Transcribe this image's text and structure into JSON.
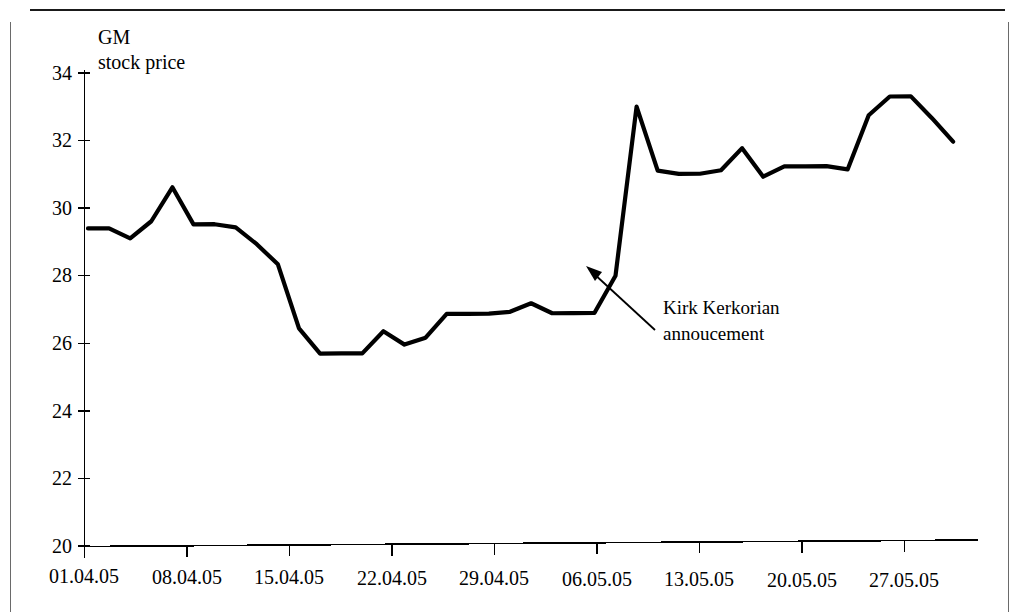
{
  "page": {
    "background": "#ffffff",
    "ink_color": "#000000"
  },
  "chart_title": {
    "line1": "GM",
    "line2": "stock price"
  },
  "annotation": {
    "line1": "Kirk Kerkorian",
    "line2": "annoucement",
    "points_to": "2005-05-04 spike"
  },
  "chart_data": {
    "type": "line",
    "title": "GM stock price",
    "xlabel": "",
    "ylabel": "",
    "ylim": [
      20,
      34
    ],
    "yticks": [
      20,
      22,
      24,
      26,
      28,
      30,
      32,
      34
    ],
    "ytick_labels": [
      "20",
      "22",
      "24",
      "26",
      "28",
      "30",
      "32",
      "34"
    ],
    "xtick_labels": [
      "01.04.05",
      "08.04.05",
      "15.04.05",
      "22.04.05",
      "29.04.05",
      "06.05.05",
      "13.05.05",
      "20.05.05",
      "27.05.05"
    ],
    "xtick_index": [
      0,
      5,
      10,
      15,
      20,
      25,
      30,
      35,
      40
    ],
    "grid": false,
    "legend": null,
    "line_color": "#000000",
    "series": [
      {
        "name": "GM stock price",
        "x": [
          "01.04.05",
          "04.04.05",
          "05.04.05",
          "06.04.05",
          "07.04.05",
          "08.04.05",
          "11.04.05",
          "12.04.05",
          "13.04.05",
          "14.04.05",
          "15.04.05",
          "18.04.05",
          "19.04.05",
          "20.04.05",
          "21.04.05",
          "22.04.05",
          "25.04.05",
          "26.04.05",
          "27.04.05",
          "28.04.05",
          "29.04.05",
          "02.05.05",
          "03.05.05",
          "04.05.05",
          "05.05.05",
          "06.05.05",
          "09.05.05",
          "10.05.05",
          "11.05.05",
          "12.05.05",
          "13.05.05",
          "16.05.05",
          "17.05.05",
          "18.05.05",
          "19.05.05",
          "20.05.05",
          "23.05.05",
          "24.05.05",
          "25.05.05",
          "26.05.05",
          "27.05.05",
          "31.05.05"
        ],
        "values": [
          29.4,
          29.4,
          29.1,
          29.6,
          30.6,
          29.5,
          29.5,
          29.4,
          28.9,
          28.3,
          26.4,
          25.65,
          25.65,
          25.65,
          26.3,
          25.9,
          26.1,
          26.8,
          26.8,
          26.8,
          26.85,
          27.1,
          26.8,
          26.8,
          26.8,
          27.9,
          32.9,
          31.0,
          30.9,
          30.9,
          31.0,
          31.65,
          30.8,
          31.1,
          31.1,
          31.1,
          31.0,
          32.6,
          33.15,
          33.15,
          32.5,
          31.8
        ]
      }
    ]
  },
  "axes": {
    "y_axis_name": "value-axis",
    "x_axis_name": "date-axis"
  }
}
